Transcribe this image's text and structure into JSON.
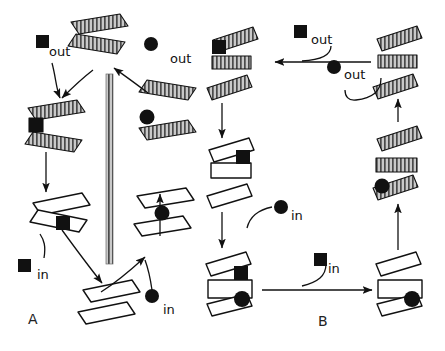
{
  "figure": {
    "type": "diagram",
    "background_color": "#ffffff",
    "line_color": "#111111",
    "hatch_fill_color": "#b9b9b9",
    "open_fill_color": "#ffffff",
    "ligand_color": "#111111"
  },
  "panels": [
    {
      "id": "A",
      "label": "A",
      "x": 28,
      "y": 318
    },
    {
      "id": "B",
      "label": "B",
      "x": 318,
      "y": 320
    }
  ],
  "labels": {
    "out": "out",
    "in": "in"
  },
  "panel_a": {
    "membrane": {
      "name": "membrane-bar",
      "x": 106,
      "y": 74,
      "width": 7,
      "height": 190
    },
    "annotations": [
      {
        "name": "out-label-square-left",
        "text": "out",
        "x": 44,
        "y": 52,
        "ligand": "square",
        "ligand_x": 36,
        "ligand_y": 35
      },
      {
        "name": "out-label-circle-right",
        "text": "out",
        "x": 168,
        "y": 57,
        "ligand": "circle",
        "ligand_x": 151,
        "ligand_y": 44
      },
      {
        "name": "in-label-square-left",
        "text": "in",
        "x": 37,
        "y": 267,
        "ligand": "square",
        "ligand_x": 18,
        "ligand_y": 259
      },
      {
        "name": "in-label-circle-right",
        "text": "in",
        "x": 163,
        "y": 307,
        "ligand": "circle",
        "ligand_x": 152,
        "ligand_y": 296
      }
    ],
    "complexes": [
      {
        "name": "complex-a-top-hatched-open",
        "state": "outward-open-empty",
        "fill": "hatched",
        "ligand": "none"
      },
      {
        "name": "complex-a-left-hatched-square",
        "state": "outward-bound-square",
        "fill": "hatched",
        "ligand": "square"
      },
      {
        "name": "complex-a-right-hatched-circle",
        "state": "outward-bound-circle",
        "fill": "hatched",
        "ligand": "circle"
      },
      {
        "name": "complex-a-left-open-square",
        "state": "inward-bound-square",
        "fill": "open",
        "ligand": "square"
      },
      {
        "name": "complex-a-right-open-circle",
        "state": "inward-bound-circle",
        "fill": "open",
        "ligand": "circle"
      },
      {
        "name": "complex-a-bottom-open-empty",
        "state": "inward-open-empty",
        "fill": "open",
        "ligand": "none"
      }
    ]
  },
  "panel_b": {
    "annotations": [
      {
        "name": "out-label-square",
        "text": "out",
        "x": 307,
        "y": 41,
        "ligand": "square",
        "ligand_x": 294,
        "ligand_y": 25
      },
      {
        "name": "out-label-circle",
        "text": "out",
        "x": 340,
        "y": 71,
        "ligand": "circle",
        "ligand_x": 327,
        "ligand_y": 61
      },
      {
        "name": "in-label-circle",
        "text": "in",
        "x": 288,
        "y": 213,
        "ligand": "circle",
        "ligand_x": 275,
        "ligand_y": 201
      },
      {
        "name": "in-label-square",
        "text": "in",
        "x": 325,
        "y": 268,
        "ligand": "square",
        "ligand_x": 314,
        "ligand_y": 253
      }
    ],
    "complexes": [
      {
        "name": "complex-b-topleft-hatched-square",
        "state": "outward-bound-square",
        "fill": "hatched",
        "ligand": "square"
      },
      {
        "name": "complex-b-topright-hatched-empty",
        "state": "outward-open-empty",
        "fill": "hatched",
        "ligand": "none"
      },
      {
        "name": "complex-b-midright-hatched-circle",
        "state": "outward-bound-circle",
        "fill": "hatched",
        "ligand": "circle"
      },
      {
        "name": "complex-b-midleft-open-square",
        "state": "inward-bound-square",
        "fill": "open",
        "ligand": "square"
      },
      {
        "name": "complex-b-bottomleft-open-both",
        "state": "inward-bound-square-and-circle",
        "fill": "open",
        "ligand": "square+circle"
      },
      {
        "name": "complex-b-bottomright-open-circle",
        "state": "inward-bound-circle",
        "fill": "open",
        "ligand": "circle"
      }
    ]
  }
}
